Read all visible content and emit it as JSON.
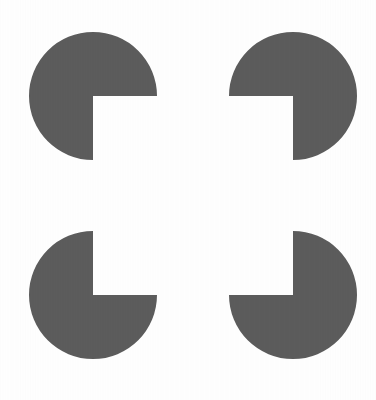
{
  "figure": {
    "canvas": {
      "width": 376,
      "height": 400,
      "background_color": "#fefefe"
    },
    "inducer_color": "#5c5c5c",
    "inducer_radius": 64,
    "wedge_angle_degrees": 90,
    "inducers": [
      {
        "id": "top-left",
        "label": "top-left inducer disc",
        "center_x": 93,
        "center_y": 96,
        "radius": 64,
        "notch_facing": "lower-right",
        "wedge_start_degrees": 0,
        "wedge_end_degrees": 90
      },
      {
        "id": "top-right",
        "label": "top-right inducer disc",
        "center_x": 293,
        "center_y": 96,
        "radius": 64,
        "notch_facing": "lower-left",
        "wedge_start_degrees": 90,
        "wedge_end_degrees": 180
      },
      {
        "id": "bottom-left",
        "label": "bottom-left inducer disc",
        "center_x": 93,
        "center_y": 295,
        "radius": 64,
        "notch_facing": "upper-right",
        "wedge_start_degrees": 270,
        "wedge_end_degrees": 360
      },
      {
        "id": "bottom-right",
        "label": "bottom-right inducer disc",
        "center_x": 293,
        "center_y": 295,
        "radius": 64,
        "notch_facing": "upper-left",
        "wedge_start_degrees": 180,
        "wedge_end_degrees": 270
      }
    ],
    "illusory_figure": {
      "shape": "square",
      "left": 93,
      "top": 96,
      "width": 200,
      "height": 199,
      "fill": "none"
    },
    "caption_remnant": {
      "visible_text": "",
      "note": "clipped ink at bottom edge"
    }
  }
}
